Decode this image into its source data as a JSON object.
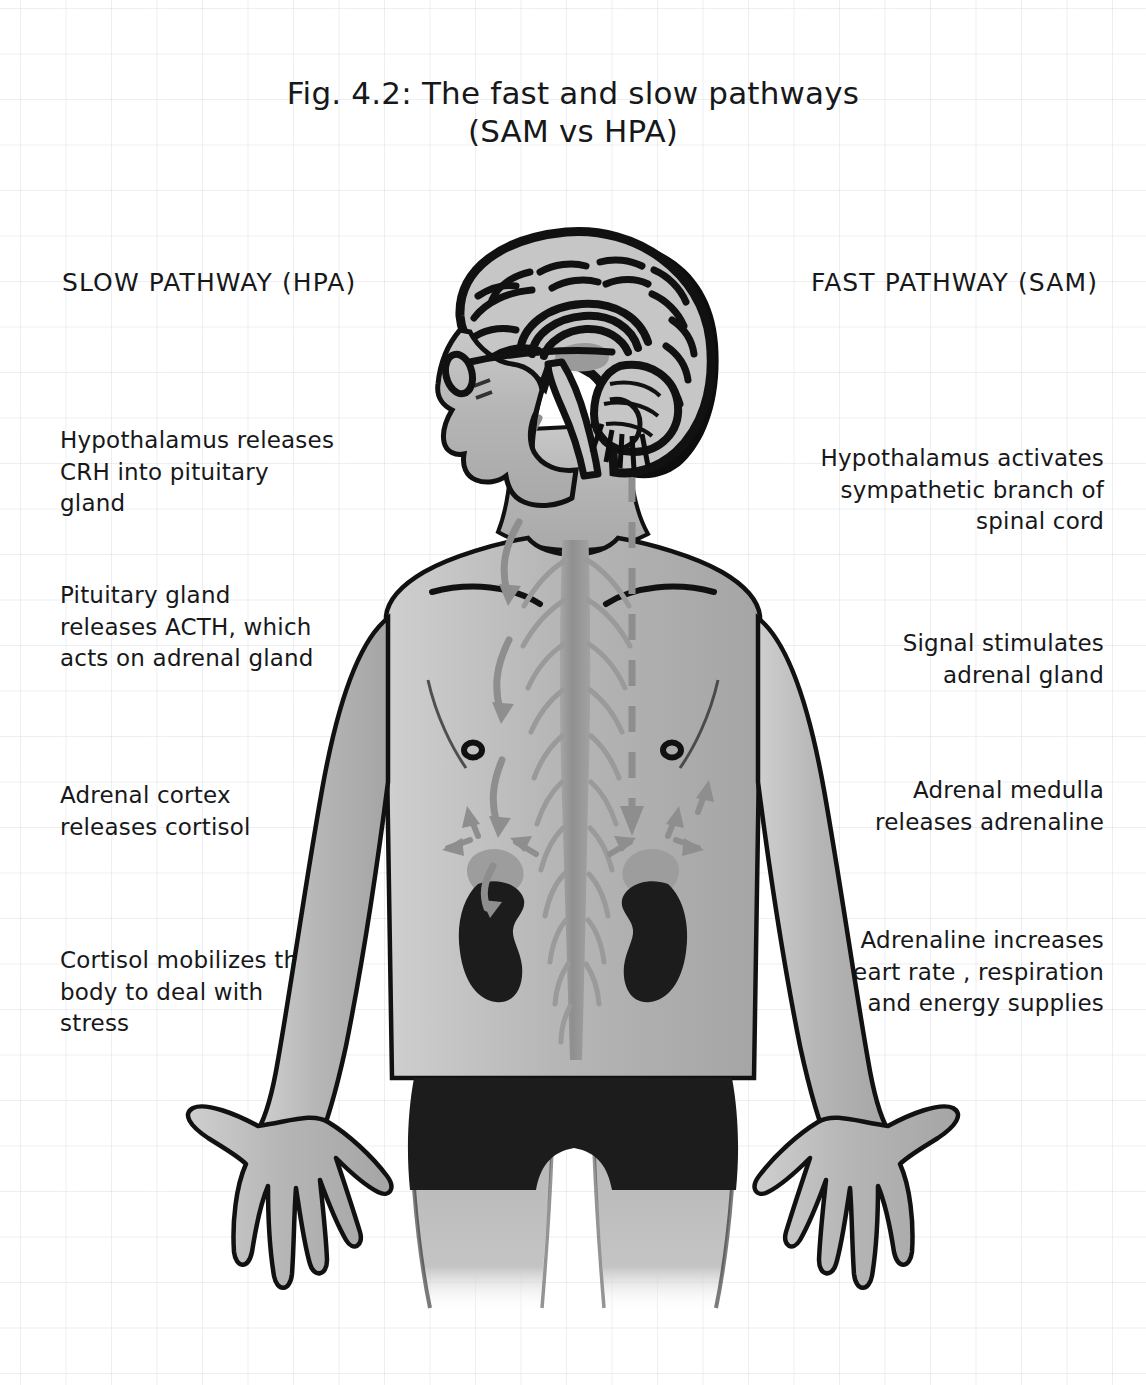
{
  "figure": {
    "title_line_1": "Fig. 4.2: The fast and slow pathways",
    "title_line_2": "(SAM vs HPA)"
  },
  "slow_pathway": {
    "heading": "SLOW PATHWAY (HPA)",
    "steps": [
      {
        "text": "Hypothalamus releases CRH into pituitary gland"
      },
      {
        "text": "Pituitary gland releases ACTH, which acts on adrenal gland"
      },
      {
        "text": "Adrenal cortex releases cortisol"
      },
      {
        "text": "Cortisol mobilizes the body to deal with stress"
      }
    ]
  },
  "fast_pathway": {
    "heading": "FAST PATHWAY (SAM)",
    "steps": [
      {
        "text": "Hypothalamus activates sympathetic branch of spinal cord"
      },
      {
        "text": "Signal stimulates adrenal gland"
      },
      {
        "text": "Adrenal medulla releases adrenaline"
      },
      {
        "text": "Adrenaline increases heart rate , respiration and energy supplies"
      }
    ]
  },
  "anatomy": {
    "parts": [
      "head-sagittal-section",
      "brain-cerebrum",
      "corpus-callosum",
      "brainstem",
      "cerebellum",
      "glasses",
      "spinal-cord",
      "left-kidney",
      "right-kidney",
      "left-adrenal-gland",
      "right-adrenal-gland",
      "torso",
      "arms",
      "hands",
      "shorts"
    ]
  },
  "colors": {
    "ink": "#17181a",
    "skin_fill": "#b3b3b3",
    "skin_fill_light": "#c6c6c6",
    "outline": "#111111",
    "arrow_gray": "#8e8e8e",
    "spine_gray": "#9a9a9a",
    "shorts_black": "#1c1c1c",
    "grid_line": "#dfe3ea",
    "page_white": "#ffffff"
  }
}
